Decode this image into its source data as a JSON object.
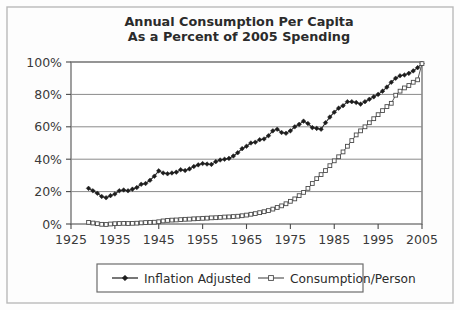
{
  "figure": {
    "background_color": "#fdfdfd",
    "border_color": "#b9b9b9",
    "plot_background_color": "#ffffff",
    "axis_color": "#6d6d6d",
    "gridline_color": "#8a8a8a"
  },
  "chart_data": {
    "type": "line",
    "title": "Annual Consumption Per Capita\nAs a Percent of 2005 Spending",
    "title_line1": "Annual Consumption Per Capita",
    "title_line2": "As a Percent of 2005 Spending",
    "xlabel": "",
    "ylabel": "",
    "xlim": [
      1925,
      2005
    ],
    "ylim": [
      0,
      100
    ],
    "grid": true,
    "grid_axis": "y",
    "legend_position": "below-plot",
    "xticks": [
      1925,
      1935,
      1945,
      1955,
      1965,
      1975,
      1985,
      1995,
      2005
    ],
    "xticklabels": [
      "1925",
      "1935",
      "1945",
      "1955",
      "1965",
      "1975",
      "1985",
      "1995",
      "2005"
    ],
    "yticks": [
      0,
      20,
      40,
      60,
      80,
      100
    ],
    "yticklabels": [
      "0%",
      "20%",
      "40%",
      "60%",
      "80%",
      "100%"
    ],
    "x": [
      1929,
      1930,
      1931,
      1932,
      1933,
      1934,
      1935,
      1936,
      1937,
      1938,
      1939,
      1940,
      1941,
      1942,
      1943,
      1944,
      1945,
      1946,
      1947,
      1948,
      1949,
      1950,
      1951,
      1952,
      1953,
      1954,
      1955,
      1956,
      1957,
      1958,
      1959,
      1960,
      1961,
      1962,
      1963,
      1964,
      1965,
      1966,
      1967,
      1968,
      1969,
      1970,
      1971,
      1972,
      1973,
      1974,
      1975,
      1976,
      1977,
      1978,
      1979,
      1980,
      1981,
      1982,
      1983,
      1984,
      1985,
      1986,
      1987,
      1988,
      1989,
      1990,
      1991,
      1992,
      1993,
      1994,
      1995,
      1996,
      1997,
      1998,
      1999,
      2000,
      2001,
      2002,
      2003,
      2004,
      2005
    ],
    "series": [
      {
        "name": "Inflation Adjusted",
        "marker": "filled-diamond",
        "color": "#1d1d1d",
        "values": [
          22.0,
          20.5,
          19.0,
          17.0,
          16.2,
          17.5,
          18.5,
          20.5,
          21.0,
          20.5,
          21.5,
          22.5,
          24.5,
          25.0,
          27.0,
          29.5,
          32.8,
          31.5,
          31.0,
          31.5,
          32.0,
          33.5,
          33.0,
          34.0,
          35.5,
          36.5,
          37.3,
          37.0,
          36.8,
          38.5,
          39.5,
          40.0,
          40.5,
          42.0,
          44.0,
          46.5,
          48.0,
          50.0,
          50.5,
          52.0,
          52.5,
          54.5,
          57.5,
          58.5,
          56.5,
          56.0,
          57.5,
          60.0,
          61.5,
          63.5,
          62.0,
          59.5,
          59.0,
          58.5,
          62.5,
          66.0,
          69.0,
          71.5,
          73.0,
          75.5,
          75.5,
          75.0,
          74.0,
          75.5,
          77.0,
          78.5,
          80.0,
          82.0,
          84.5,
          87.5,
          90.0,
          91.5,
          92.0,
          93.0,
          94.5,
          96.5,
          99.0
        ]
      },
      {
        "name": "Consumption/Person",
        "marker": "open-square",
        "color": "#4a4a4a",
        "values": [
          1.0,
          0.6,
          0.2,
          -0.2,
          -0.3,
          0.0,
          0.2,
          0.3,
          0.4,
          0.3,
          0.4,
          0.5,
          0.7,
          0.9,
          1.0,
          1.1,
          1.4,
          1.9,
          2.2,
          2.4,
          2.5,
          2.7,
          2.9,
          3.0,
          3.2,
          3.3,
          3.5,
          3.6,
          3.8,
          3.9,
          4.1,
          4.3,
          4.4,
          4.6,
          4.8,
          5.1,
          5.5,
          6.0,
          6.4,
          7.0,
          7.6,
          8.3,
          9.2,
          10.2,
          11.2,
          12.5,
          14.0,
          15.5,
          17.5,
          19.5,
          22.0,
          25.0,
          28.0,
          30.5,
          33.0,
          36.0,
          39.0,
          41.5,
          44.5,
          48.0,
          51.5,
          55.0,
          57.5,
          60.0,
          62.5,
          65.0,
          67.5,
          70.0,
          72.5,
          74.5,
          79.5,
          82.0,
          84.0,
          85.5,
          87.5,
          89.0,
          99.0
        ]
      }
    ]
  },
  "legend": {
    "entries": [
      {
        "label": "Inflation Adjusted",
        "marker": "filled-diamond"
      },
      {
        "label": "Consumption/Person",
        "marker": "open-square"
      }
    ]
  }
}
